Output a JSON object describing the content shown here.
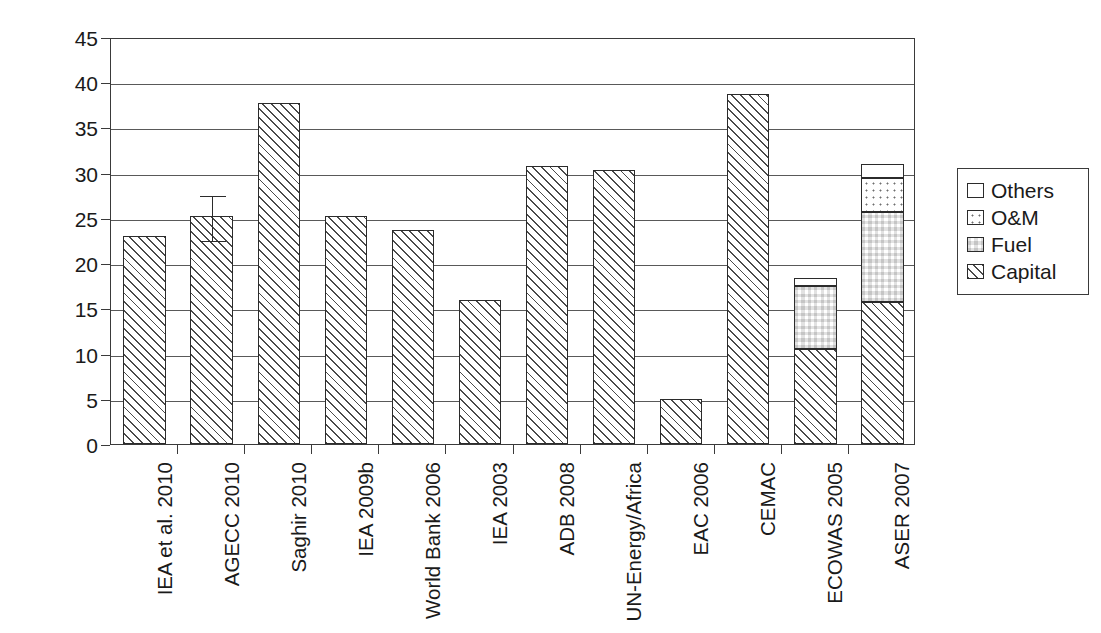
{
  "chart_data": {
    "type": "bar",
    "title": "",
    "subtitle": "",
    "xlabel": "",
    "ylabel": "Cost [USD/(caplta*year)]",
    "ylim": [
      0,
      45
    ],
    "ytick_values": [
      0,
      5,
      10,
      15,
      20,
      25,
      30,
      35,
      40,
      45
    ],
    "ytick_labels": [
      "0",
      "5",
      "10",
      "15",
      "20",
      "25",
      "30",
      "35",
      "40",
      "45"
    ],
    "grid": "horizontal",
    "stacked": true,
    "legend_position": "right",
    "legend": [
      "Others",
      "O&M",
      "Fuel",
      "Capital"
    ],
    "categories": [
      "IEA et al. 2010",
      "AGECC 2010",
      "Saghir 2010",
      "IEA 2009b",
      "World Bank 2006",
      "IEA 2003",
      "ADB 2008",
      "UN-Energy/Africa",
      "EAC 2006",
      "CEMAC",
      "ECOWAS 2005",
      "ASER 2007"
    ],
    "series": [
      {
        "name": "Capital",
        "pattern": "diagonal-hatch",
        "values": [
          23.0,
          25.2,
          37.7,
          25.2,
          23.7,
          15.9,
          30.7,
          30.3,
          5.0,
          38.7,
          10.5,
          15.7
        ]
      },
      {
        "name": "Fuel",
        "pattern": "checkerboard",
        "values": [
          0,
          0,
          0,
          0,
          0,
          0,
          0,
          0,
          0,
          0,
          7.0,
          10.0
        ]
      },
      {
        "name": "O&M",
        "pattern": "fine-dots",
        "values": [
          0,
          0,
          0,
          0,
          0,
          0,
          0,
          0,
          0,
          0,
          0,
          3.7
        ]
      },
      {
        "name": "Others",
        "pattern": "solid-white",
        "values": [
          0,
          0,
          0,
          0,
          0,
          0,
          0,
          0,
          0,
          0,
          0.9,
          1.6
        ]
      }
    ],
    "totals": [
      23.0,
      25.2,
      37.7,
      25.2,
      23.7,
      15.9,
      30.7,
      30.3,
      5.0,
      38.7,
      18.4,
      31.0
    ],
    "error_bars": [
      {
        "category": "AGECC 2010",
        "value": 25.2,
        "upper": 27.6,
        "lower": 22.6
      }
    ]
  },
  "legend_items": [
    {
      "label": "Others",
      "swatch": "solid-white"
    },
    {
      "label": "O&M",
      "swatch": "fine-dots"
    },
    {
      "label": "Fuel",
      "swatch": "checkerboard"
    },
    {
      "label": "Capital",
      "swatch": "diagonal-hatch"
    }
  ]
}
